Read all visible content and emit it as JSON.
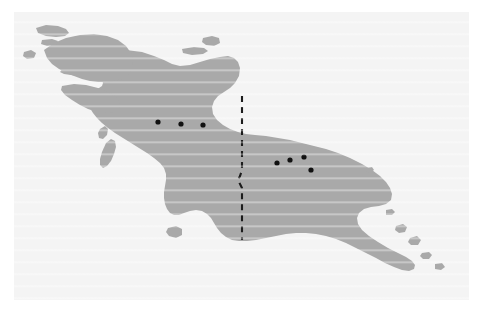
{
  "figure": {
    "kind": "reference-map",
    "region_name": "New Guinea",
    "panel_background": "#f4f4f4",
    "page_background": "#ffffff"
  },
  "map": {
    "land_color": "#a9a9a9",
    "sea_color": "#f4f4f4",
    "dot_color": "#111111",
    "border_color": "#1c1c1c",
    "border_style": "dashed",
    "viewbox": "0 0 455 288",
    "landmasses": [
      {
        "name": "new-guinea-mainland",
        "path": "M 46 60 L 54 50 L 66 44 L 80 40 L 96 38 L 112 38 L 128 40 L 140 44 L 150 48 L 158 52 L 166 54 L 176 53 L 186 50 L 196 47 L 206 45 L 214 44 L 220 46 L 224 50 L 226 56 L 225 64 L 221 71 L 216 76 L 210 80 L 204 84 L 200 89 L 198 95 L 199 102 L 203 108 L 209 113 L 216 117 L 224 120 L 232 122 L 241 123 L 252 124 L 264 126 L 276 128 L 288 131 L 300 134 L 312 137 L 324 141 L 336 146 L 348 152 L 358 158 L 366 164 L 372 170 L 376 176 L 378 182 L 377 188 L 372 192 L 365 194 L 357 195 L 350 197 L 345 201 L 343 206 L 344 212 L 348 218 L 355 224 L 364 230 L 374 236 L 384 241 L 392 245 L 398 249 L 401 253 L 400 257 L 395 259 L 388 258 L 380 255 L 371 251 L 362 246 L 352 241 L 342 236 L 332 231 L 322 227 L 312 224 L 302 222 L 292 221 L 282 221 L 272 222 L 262 224 L 252 226 L 242 228 L 233 229 L 225 229 L 218 228 L 212 225 L 207 221 L 203 216 L 200 211 L 197 206 L 193 202 L 188 199 L 182 198 L 176 199 L 170 201 L 165 203 L 160 203 L 156 201 L 153 197 L 151 192 L 150 186 L 150 180 L 151 174 L 152 168 L 152 162 L 150 156 L 146 151 L 140 146 L 133 141 L 125 136 L 117 131 L 109 126 L 101 121 L 94 116 L 88 111 L 83 106 L 79 101 L 76 96 L 74 91 L 73 86 L 74 82 L 77 79 L 81 77 L 85 76 L 88 74 L 89 71 L 88 68 L 84 66 L 78 65 L 71 65 L 64 64 L 57 63 L 50 62 Z"
      },
      {
        "name": "birds-head-north-lobe",
        "path": "M 30 38 L 40 31 L 52 26 L 66 23 L 80 22 L 93 24 L 104 28 L 112 34 L 117 41 L 119 49 L 118 57 L 114 63 L 108 67 L 100 69 L 92 70 L 84 70 L 76 69 L 68 67 L 60 64 L 52 61 L 45 57 L 38 52 L 33 46 Z"
      },
      {
        "name": "birds-neck-south-lobe",
        "path": "M 48 74 L 60 72 L 72 73 L 84 76 L 94 80 L 102 85 L 106 91 L 105 97 L 100 100 L 92 101 L 83 100 L 74 97 L 66 93 L 58 88 L 51 83 L 47 78 Z"
      },
      {
        "name": "misool-island",
        "path": "M 92 131 L 97 127 L 101 129 L 102 135 L 100 142 L 97 149 L 93 154 L 89 156 L 86 153 L 86 147 L 88 140 Z"
      },
      {
        "name": "salawati-island",
        "path": "M 86 117 L 91 114 L 94 117 L 93 123 L 89 127 L 85 126 L 84 121 Z"
      },
      {
        "name": "waigeo-island",
        "path": "M 22 16 L 32 13 L 44 14 L 52 17 L 55 21 L 51 24 L 42 25 L 32 24 L 24 21 Z"
      },
      {
        "name": "kofiau-island",
        "path": "M 10 40 L 17 38 L 22 41 L 20 46 L 13 47 L 9 44 Z"
      },
      {
        "name": "batanta-island",
        "path": "M 28 28 L 38 27 L 44 29 L 42 33 L 33 34 L 27 32 Z"
      },
      {
        "name": "yapen-island",
        "path": "M 168 37 L 180 35 L 190 36 L 194 39 L 189 42 L 178 43 L 169 41 Z"
      },
      {
        "name": "biak-island",
        "path": "M 189 26 L 198 24 L 205 26 L 206 31 L 200 34 L 192 33 L 188 30 Z"
      },
      {
        "name": "dolak-island",
        "path": "M 154 216 L 162 214 L 168 217 L 168 223 L 162 226 L 155 224 L 152 220 Z"
      },
      {
        "name": "dentrecasteaux-island-1",
        "path": "M 382 214 L 389 212 L 393 215 L 391 220 L 385 221 L 381 218 Z"
      },
      {
        "name": "dentrecasteaux-island-2",
        "path": "M 396 226 L 403 224 L 407 228 L 404 233 L 397 233 L 394 230 Z"
      },
      {
        "name": "louisiade-island-1",
        "path": "M 408 241 L 415 240 L 418 243 L 415 247 L 409 247 L 406 244 Z"
      },
      {
        "name": "louisiade-island-2",
        "path": "M 421 252 L 428 251 L 431 255 L 427 258 L 421 257 Z"
      },
      {
        "name": "trobriand-island",
        "path": "M 372 198 L 378 197 L 381 200 L 378 203 L 372 203 Z"
      },
      {
        "name": "small-island-north-east",
        "path": "M 352 156 L 358 155 L 360 158 L 356 161 L 351 159 Z"
      }
    ],
    "border": {
      "name": "indonesia-papua-new-guinea-border",
      "path": "M 228 84 L 228 112 L 228 140 L 228 158 L 226 164 L 224 168 L 226 172 L 228 176 L 228 196 L 228 216 L 228 228"
    },
    "sites": [
      {
        "id": "site-west-1",
        "x": 144,
        "y": 110,
        "r": 2.6
      },
      {
        "id": "site-west-2",
        "x": 167,
        "y": 112,
        "r": 2.6
      },
      {
        "id": "site-west-3",
        "x": 189,
        "y": 113,
        "r": 2.6
      },
      {
        "id": "site-east-1",
        "x": 263,
        "y": 151,
        "r": 2.6
      },
      {
        "id": "site-east-2",
        "x": 276,
        "y": 148,
        "r": 2.6
      },
      {
        "id": "site-east-3",
        "x": 290,
        "y": 145,
        "r": 2.6
      },
      {
        "id": "site-east-4",
        "x": 297,
        "y": 158,
        "r": 2.6
      }
    ]
  }
}
